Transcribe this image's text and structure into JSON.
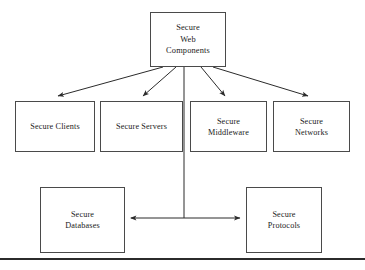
{
  "diagram": {
    "type": "hierarchy-block-diagram",
    "title": "Secure Web Components",
    "background_color": "#ffffff",
    "box_border_color": "#4a4a4a",
    "line_color": "#2b2b2b",
    "text_color": "#1a1a1a",
    "nodes": [
      {
        "id": "root",
        "label": "Secure\nWeb\nComponents",
        "x": 150,
        "y": 12,
        "w": 76,
        "h": 55
      },
      {
        "id": "clients",
        "label": "Secure Clients",
        "x": 15,
        "y": 101,
        "w": 80,
        "h": 51
      },
      {
        "id": "servers",
        "label": "Secure Servers",
        "x": 100,
        "y": 101,
        "w": 83,
        "h": 51
      },
      {
        "id": "middleware",
        "label": "Secure\nMiddleware",
        "x": 190,
        "y": 101,
        "w": 77,
        "h": 51
      },
      {
        "id": "networks",
        "label": "Secure\nNetworks",
        "x": 273,
        "y": 101,
        "w": 77,
        "h": 51
      },
      {
        "id": "databases",
        "label": "Secure\nDatabases",
        "x": 40,
        "y": 187,
        "w": 85,
        "h": 66
      },
      {
        "id": "protocols",
        "label": "Secure\nProtocols",
        "x": 246,
        "y": 187,
        "w": 76,
        "h": 66
      }
    ],
    "edges": [
      {
        "id": "root-to-clients",
        "from": "root",
        "to": "clients",
        "style": "arrow-single"
      },
      {
        "id": "root-to-servers",
        "from": "root",
        "to": "servers",
        "style": "arrow-single"
      },
      {
        "id": "root-to-middleware",
        "from": "root",
        "to": "middleware",
        "style": "arrow-single"
      },
      {
        "id": "root-to-networks",
        "from": "root",
        "to": "networks",
        "style": "arrow-single"
      },
      {
        "id": "root-trunk",
        "from": "root",
        "to": "junction",
        "style": "plain-line"
      },
      {
        "id": "databases-to-protocols",
        "from": "databases",
        "to": "protocols",
        "style": "arrow-double"
      }
    ],
    "bottom_rule": {
      "y": 258,
      "thickness": 2
    }
  }
}
